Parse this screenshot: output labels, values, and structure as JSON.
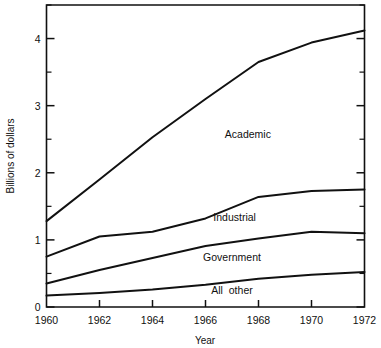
{
  "chart_data": {
    "type": "line",
    "title": "",
    "xlabel": "Year",
    "ylabel": "Billions of dollars",
    "x": [
      1960,
      1962,
      1964,
      1966,
      1968,
      1970,
      1972
    ],
    "xlim": [
      1960,
      1972
    ],
    "ylim": [
      0,
      4.5
    ],
    "grid": false,
    "legend_position": "inline-annotations",
    "x_tick_labels": [
      "1960",
      "1962",
      "1964",
      "1966",
      "1968",
      "1970",
      "1972"
    ],
    "y_tick_labels": [
      "0",
      "1",
      "2",
      "3",
      "4"
    ],
    "y_major_ticks": [
      0,
      1,
      2,
      3,
      4
    ],
    "y_minor_ticks": [
      0.5,
      1.5,
      2.5,
      3.5,
      4.5
    ],
    "stacking": "cumulative-boundaries",
    "series": [
      {
        "name": "All other",
        "label": "All  other",
        "values": [
          0.17,
          0.21,
          0.26,
          0.33,
          0.42,
          0.48,
          0.52
        ],
        "label_x": 1967.0,
        "label_y": 0.2
      },
      {
        "name": "Government",
        "label": "Government",
        "values": [
          0.35,
          0.55,
          0.73,
          0.91,
          1.02,
          1.12,
          1.1
        ],
        "label_x": 1967.0,
        "label_y": 0.68
      },
      {
        "name": "Industrial",
        "label": "Industrial",
        "values": [
          0.75,
          1.05,
          1.12,
          1.32,
          1.64,
          1.73,
          1.75
        ],
        "label_x": 1967.1,
        "label_y": 1.28
      },
      {
        "name": "Academic",
        "label": "Academic",
        "values": [
          1.28,
          1.9,
          2.53,
          3.1,
          3.65,
          3.94,
          4.12
        ],
        "label_x": 1967.6,
        "label_y": 2.52
      }
    ]
  }
}
